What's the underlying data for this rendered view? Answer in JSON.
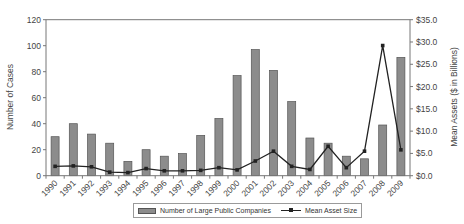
{
  "chart_data": {
    "type": "bar",
    "title": "",
    "xlabel": "",
    "ylabel": "Number of Cases",
    "y2label": "Mean Assets ($ in Billions)",
    "categories": [
      "1990",
      "1991",
      "1992",
      "1993",
      "1994",
      "1995",
      "1996",
      "1997",
      "1998",
      "1999",
      "2000",
      "2001",
      "2002",
      "2003",
      "2004",
      "2005",
      "2006",
      "2007",
      "2008",
      "2009"
    ],
    "series": [
      {
        "name": "Number of Large Public Companies",
        "type": "bar",
        "axis": "left",
        "color": "#8c8c8c",
        "values": [
          30,
          40,
          32,
          25,
          11,
          20,
          15,
          17,
          31,
          44,
          77,
          97,
          81,
          57,
          29,
          25,
          15,
          13,
          39,
          91
        ]
      },
      {
        "name": "Mean Asset Size",
        "type": "line",
        "axis": "right",
        "color": "#222222",
        "values": [
          2.1,
          2.2,
          2.0,
          0.8,
          0.7,
          1.6,
          1.1,
          1.1,
          1.2,
          1.8,
          1.3,
          3.3,
          5.5,
          2.1,
          1.4,
          6.6,
          1.8,
          5.5,
          29.2,
          5.8
        ]
      }
    ],
    "ylim": [
      0,
      120
    ],
    "y2lim": [
      0,
      35
    ],
    "yticks": [
      "0",
      "20",
      "40",
      "60",
      "80",
      "100",
      "120"
    ],
    "y2ticks": [
      "$0.0",
      "$5.0",
      "$10.0",
      "$15.0",
      "$20.0",
      "$25.0",
      "$30.0",
      "$35.0"
    ],
    "grid": false,
    "legend_position": "bottom"
  },
  "legend": {
    "bar_label": "Number of Large Public Companies",
    "line_label": "Mean Asset Size"
  },
  "axes": {
    "left_title": "Number of Cases",
    "right_title": "Mean Assets ($ in Billions)"
  }
}
